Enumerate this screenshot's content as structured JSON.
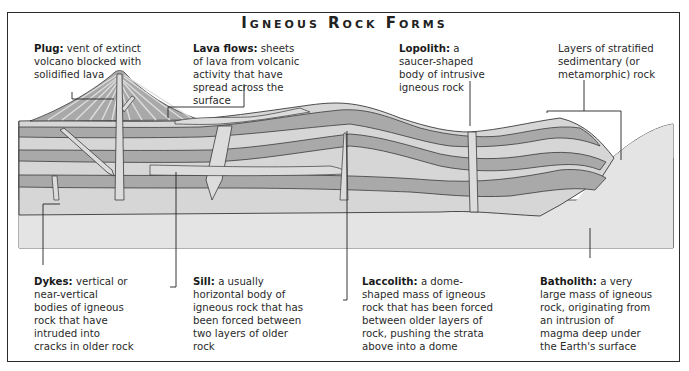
{
  "title": "Igneous Rock Forms",
  "colors": {
    "strata_dark": "#a9a9a9",
    "strata_light": "#d6d6d6",
    "igneous": "#dcdcdc",
    "basement": "#e4e4e4",
    "outline": "#3a3a3a",
    "background": "#ffffff"
  },
  "labels": {
    "plug": {
      "term": "Plug:",
      "desc": "vent of extinct volcano blocked with solidified lava"
    },
    "lava_flows": {
      "term": "Lava flows:",
      "desc": "sheets of lava from volcanic activity that have spread across the surface"
    },
    "lopolith": {
      "term": "Lopolith:",
      "desc": "a saucer-shaped body of intrusive igneous rock"
    },
    "strata": {
      "term": "",
      "desc": "Layers of stratified sedimentary (or metamorphic) rock"
    },
    "dykes": {
      "term": "Dykes:",
      "desc": "vertical or near-vertical bodies of igneous rock that have intruded into cracks in older rock"
    },
    "sill": {
      "term": "Sill:",
      "desc": "a usually horizontal body of igneous rock that has been forced between two layers of older rock"
    },
    "laccolith": {
      "term": "Laccolith:",
      "desc": "a dome-shaped mass of igneous rock that has been forced between older layers of rock, pushing the strata above into a dome"
    },
    "batholith": {
      "term": "Batholith:",
      "desc": "a very large mass of igneous rock, originating from an intrusion of magma deep under the Earth's surface"
    }
  }
}
